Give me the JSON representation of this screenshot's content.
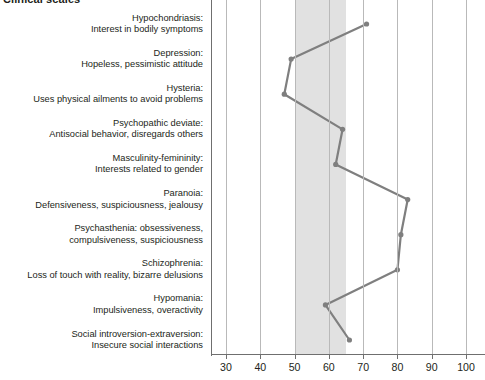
{
  "chart_heading": "Clinical scales",
  "chart_data": {
    "type": "line",
    "title": "Clinical scales",
    "orientation": "horizontal",
    "xlabel": "",
    "ylabel": "",
    "xlim": [
      30,
      100
    ],
    "xticks": [
      30,
      40,
      50,
      60,
      70,
      80,
      90,
      100
    ],
    "xticklabels": [
      "30",
      "40",
      "50",
      "60",
      "70",
      "80",
      "90",
      "100"
    ],
    "grid": true,
    "legend": "none",
    "normal_band": {
      "from": 50,
      "to": 65,
      "color": "#dcdcdc"
    },
    "line_color": "#7f7f7f",
    "marker": "circle",
    "categories": [
      "Hypochondriasis",
      "Depression",
      "Hysteria",
      "Psychopathic deviate",
      "Masculinity-femininity",
      "Paranoia",
      "Psychasthenia",
      "Schizophrenia",
      "Hypomania",
      "Social introversion-extraversion"
    ],
    "values": [
      71,
      49,
      47,
      64,
      62,
      83,
      81,
      80,
      59,
      66
    ]
  },
  "scales": [
    {
      "name": "Hypochondriasis:",
      "description": "Interest in bodily symptoms",
      "value": 71
    },
    {
      "name": "Depression:",
      "description": "Hopeless, pessimistic attitude",
      "value": 49
    },
    {
      "name": "Hysteria:",
      "description": "Uses physical ailments to avoid problems",
      "value": 47
    },
    {
      "name": "Psychopathic deviate:",
      "description": "Antisocial behavior, disregards others",
      "value": 64
    },
    {
      "name": "Masculinity-femininity:",
      "description": "Interests related to gender",
      "value": 62
    },
    {
      "name": "Paranoia:",
      "description": "Defensiveness, suspiciousness, jealousy",
      "value": 83
    },
    {
      "name": "Psychasthenia: obsessiveness,",
      "description": "compulsiveness, suspiciousness",
      "value": 81
    },
    {
      "name": "Schizophrenia:",
      "description": "Loss of touch with reality, bizarre delusions",
      "value": 80
    },
    {
      "name": "Hypomania:",
      "description": "Impulsiveness, overactivity",
      "value": 59
    },
    {
      "name": "Social introversion-extraversion:",
      "description": "Insecure social interactions",
      "value": 66
    }
  ]
}
